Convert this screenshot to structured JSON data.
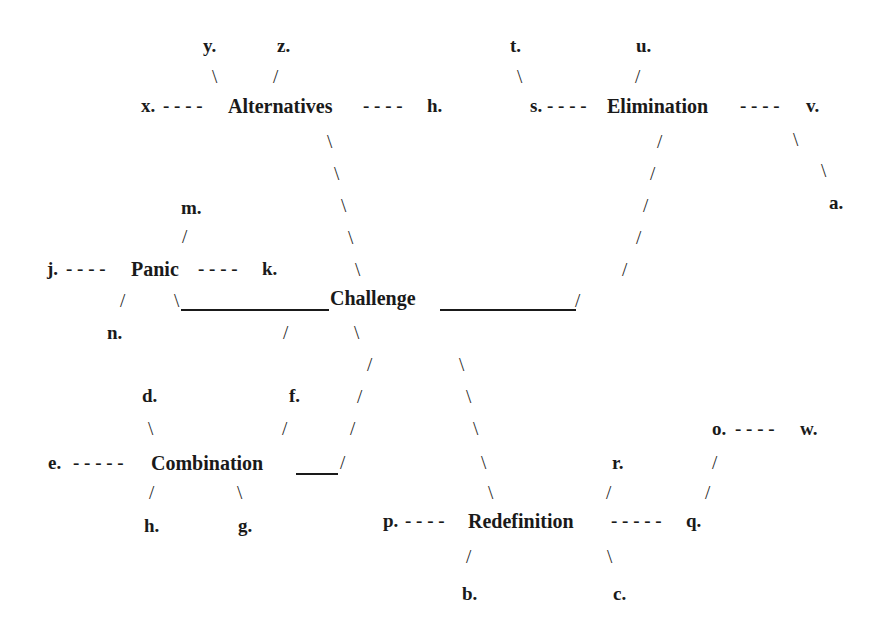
{
  "diagram": {
    "center": {
      "label": "Challenge",
      "x": 330,
      "y": 287
    },
    "nodes": [
      {
        "id": "alternatives",
        "label": "Alternatives",
        "x": 228,
        "y": 95
      },
      {
        "id": "elimination",
        "label": "Elimination",
        "x": 607,
        "y": 95
      },
      {
        "id": "panic",
        "label": "Panic",
        "x": 131,
        "y": 258
      },
      {
        "id": "combination",
        "label": "Combination",
        "x": 151,
        "y": 452
      },
      {
        "id": "redefinition",
        "label": "Redefinition",
        "x": 468,
        "y": 510
      }
    ],
    "labels": [
      {
        "id": "y",
        "text": "y.",
        "x": 203,
        "y": 35
      },
      {
        "id": "z",
        "text": "z.",
        "x": 277,
        "y": 35
      },
      {
        "id": "x",
        "text": "x.",
        "x": 141,
        "y": 95
      },
      {
        "id": "h-top",
        "text": "h.",
        "x": 427,
        "y": 95
      },
      {
        "id": "t",
        "text": "t.",
        "x": 510,
        "y": 35
      },
      {
        "id": "u",
        "text": "u.",
        "x": 636,
        "y": 35
      },
      {
        "id": "s",
        "text": "s.",
        "x": 530,
        "y": 95
      },
      {
        "id": "v",
        "text": "v.",
        "x": 806,
        "y": 95
      },
      {
        "id": "a",
        "text": "a.",
        "x": 829,
        "y": 192
      },
      {
        "id": "m",
        "text": "m.",
        "x": 181,
        "y": 197
      },
      {
        "id": "j",
        "text": "j.",
        "x": 47,
        "y": 258
      },
      {
        "id": "k",
        "text": "k.",
        "x": 262,
        "y": 258
      },
      {
        "id": "n",
        "text": "n.",
        "x": 107,
        "y": 322
      },
      {
        "id": "d",
        "text": "d.",
        "x": 142,
        "y": 385
      },
      {
        "id": "f",
        "text": "f.",
        "x": 289,
        "y": 385
      },
      {
        "id": "e",
        "text": "e.",
        "x": 48,
        "y": 452
      },
      {
        "id": "h-bottom",
        "text": "h.",
        "x": 144,
        "y": 515
      },
      {
        "id": "g",
        "text": "g.",
        "x": 238,
        "y": 515
      },
      {
        "id": "o",
        "text": "o.",
        "x": 712,
        "y": 418
      },
      {
        "id": "w",
        "text": "w.",
        "x": 800,
        "y": 418
      },
      {
        "id": "r",
        "text": "r.",
        "x": 612,
        "y": 452
      },
      {
        "id": "p",
        "text": "p.",
        "x": 383,
        "y": 510
      },
      {
        "id": "q",
        "text": "q.",
        "x": 686,
        "y": 510
      },
      {
        "id": "b",
        "text": "b.",
        "x": 462,
        "y": 583
      },
      {
        "id": "c",
        "text": "c.",
        "x": 613,
        "y": 583
      }
    ],
    "dashes": [
      {
        "id": "x-alt",
        "text": "- - - -",
        "x": 163,
        "y": 95
      },
      {
        "id": "alt-h",
        "text": "- - - -",
        "x": 363,
        "y": 95
      },
      {
        "id": "s-elim",
        "text": "- - - -",
        "x": 547,
        "y": 95
      },
      {
        "id": "elim-v",
        "text": "- - - -",
        "x": 740,
        "y": 95
      },
      {
        "id": "j-panic",
        "text": "- - - -",
        "x": 66,
        "y": 258
      },
      {
        "id": "panic-k",
        "text": "- - - -",
        "x": 198,
        "y": 258
      },
      {
        "id": "e-comb",
        "text": "- - - - -",
        "x": 73,
        "y": 452
      },
      {
        "id": "p-redef",
        "text": "- - - -",
        "x": 405,
        "y": 510
      },
      {
        "id": "redef-q",
        "text": "- - - - -",
        "x": 611,
        "y": 510
      },
      {
        "id": "o-w",
        "text": "- - - -",
        "x": 735,
        "y": 418
      }
    ],
    "strokes": [
      {
        "text": "\\",
        "x": 212,
        "y": 66
      },
      {
        "text": "/",
        "x": 273,
        "y": 66
      },
      {
        "text": "\\",
        "x": 517,
        "y": 66
      },
      {
        "text": "/",
        "x": 635,
        "y": 66
      },
      {
        "text": "\\",
        "x": 327,
        "y": 131
      },
      {
        "text": "\\",
        "x": 334,
        "y": 163
      },
      {
        "text": "\\",
        "x": 341,
        "y": 195
      },
      {
        "text": "\\",
        "x": 348,
        "y": 227
      },
      {
        "text": "\\",
        "x": 355,
        "y": 259
      },
      {
        "text": "/",
        "x": 657,
        "y": 131
      },
      {
        "text": "/",
        "x": 650,
        "y": 163
      },
      {
        "text": "/",
        "x": 643,
        "y": 195
      },
      {
        "text": "/",
        "x": 636,
        "y": 227
      },
      {
        "text": "/",
        "x": 622,
        "y": 259
      },
      {
        "text": "\\",
        "x": 793,
        "y": 129
      },
      {
        "text": "\\",
        "x": 821,
        "y": 160
      },
      {
        "text": "/",
        "x": 182,
        "y": 226
      },
      {
        "text": "/",
        "x": 120,
        "y": 290
      },
      {
        "text": "\\",
        "x": 174,
        "y": 290
      },
      {
        "text": "/",
        "x": 575,
        "y": 290
      },
      {
        "text": "/",
        "x": 283,
        "y": 322
      },
      {
        "text": "\\",
        "x": 354,
        "y": 322
      },
      {
        "text": "/",
        "x": 367,
        "y": 354
      },
      {
        "text": "\\",
        "x": 459,
        "y": 354
      },
      {
        "text": "/",
        "x": 357,
        "y": 386
      },
      {
        "text": "\\",
        "x": 466,
        "y": 386
      },
      {
        "text": "\\",
        "x": 148,
        "y": 418
      },
      {
        "text": "/",
        "x": 282,
        "y": 418
      },
      {
        "text": "/",
        "x": 350,
        "y": 418
      },
      {
        "text": "\\",
        "x": 473,
        "y": 418
      },
      {
        "text": "/",
        "x": 340,
        "y": 452
      },
      {
        "text": "\\",
        "x": 481,
        "y": 452
      },
      {
        "text": "/",
        "x": 712,
        "y": 452
      },
      {
        "text": "\\",
        "x": 488,
        "y": 482
      },
      {
        "text": "/",
        "x": 606,
        "y": 482
      },
      {
        "text": "/",
        "x": 705,
        "y": 482
      },
      {
        "text": "/",
        "x": 149,
        "y": 482
      },
      {
        "text": "\\",
        "x": 237,
        "y": 482
      },
      {
        "text": "/",
        "x": 466,
        "y": 546
      },
      {
        "text": "\\",
        "x": 607,
        "y": 546
      }
    ],
    "rules": [
      {
        "id": "panic-challenge-bar",
        "x": 181,
        "y": 309,
        "w": 148
      },
      {
        "id": "challenge-elim-bar",
        "x": 440,
        "y": 309,
        "w": 136
      },
      {
        "id": "combination-bar",
        "x": 296,
        "y": 473,
        "w": 42
      }
    ]
  }
}
